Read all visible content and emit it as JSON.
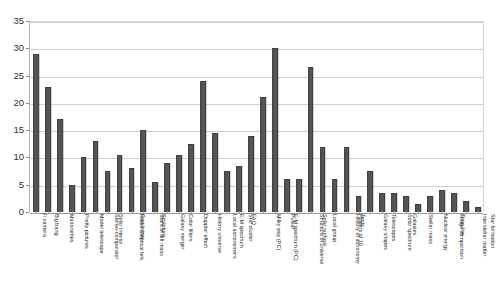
{
  "chart_data": {
    "type": "bar",
    "title": "",
    "subtitle": "",
    "xlabel": "",
    "ylabel": "",
    "ylim": [
      0,
      35
    ],
    "ytick_step": 5,
    "yticks": [
      "0",
      "5",
      "10",
      "15",
      "20",
      "25",
      "30",
      "35"
    ],
    "grid": true,
    "legend": null,
    "bar_color": "#555555",
    "bar_edge_color": "#3f3f3f",
    "gridline_color": "#d0d0d0",
    "axis_color": "#9a9a9a",
    "background": "#ffffff",
    "categories": [
      "Ir camera",
      "Big bang",
      "Marionettes",
      "Pretty pictures",
      "Model telescope",
      "Stereo-comparator",
      "Solar interior",
      "Radio & optical tels.",
      "Gas lamps",
      "Stars of diff mass",
      "Sculpture",
      "Galaxy merger",
      "Color filters",
      "Doppler effect",
      "History universe",
      "Local astronomers",
      "E-M spectrum",
      "Star cluster",
      "FAQ",
      "Milky way (PC)",
      "E-M spectrum (PC)",
      "Pulsar",
      "Structure of universe",
      "Solar surface",
      "Local group",
      "History of astronomy",
      "Powers of 10",
      "Texts",
      "Galaxy shapes",
      "Telescopes",
      "Solar spectrum",
      "Galaxies",
      "Stellar mass",
      "Nuclear energy",
      "Image comparison",
      "Time line",
      "Interstellar matter",
      "Star formation"
    ],
    "values": [
      29,
      23,
      17,
      5,
      10,
      13,
      7.5,
      10.5,
      8,
      15,
      5.5,
      9,
      10.5,
      12.5,
      24,
      14.5,
      7.5,
      8.5,
      14,
      21,
      30,
      6,
      6,
      26.5,
      12,
      6,
      12,
      3,
      7.5,
      3.5,
      3.5,
      3,
      1.5,
      3,
      4,
      3.5,
      2,
      1
    ]
  }
}
